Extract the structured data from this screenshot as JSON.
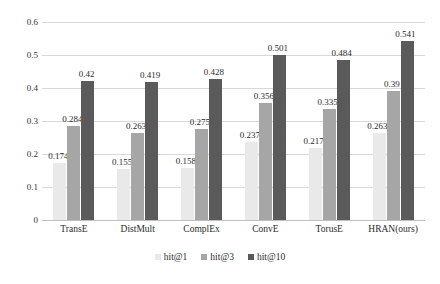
{
  "chart_data": {
    "type": "bar",
    "title": "",
    "xlabel": "",
    "ylabel": "",
    "ylim": [
      0,
      0.6
    ],
    "yticks": [
      "0",
      "0.1",
      "0.2",
      "0.3",
      "0.4",
      "0.5",
      "0.6"
    ],
    "grid": true,
    "legend_position": "bottom",
    "categories": [
      "TransE",
      "DistMult",
      "ComplEx",
      "ConvE",
      "TorusE",
      "HRAN(ours)"
    ],
    "series": [
      {
        "name": "hit@1",
        "color": "#e9e9e9",
        "values": [
          0.174,
          0.155,
          0.158,
          0.237,
          0.217,
          0.263
        ],
        "labels": [
          "0.174",
          "0.155",
          "0.158",
          "0.237",
          "0.217",
          "0.263"
        ]
      },
      {
        "name": "hit@3",
        "color": "#a6a6a6",
        "values": [
          0.284,
          0.263,
          0.275,
          0.356,
          0.335,
          0.39
        ],
        "labels": [
          "0.284",
          "0.263",
          "0.275",
          "0.356",
          "0.335",
          "0.39"
        ]
      },
      {
        "name": "hit@10",
        "color": "#5a5a5a",
        "values": [
          0.42,
          0.419,
          0.428,
          0.501,
          0.484,
          0.541
        ],
        "labels": [
          "0.42",
          "0.419",
          "0.428",
          "0.501",
          "0.484",
          "0.541"
        ]
      }
    ]
  }
}
